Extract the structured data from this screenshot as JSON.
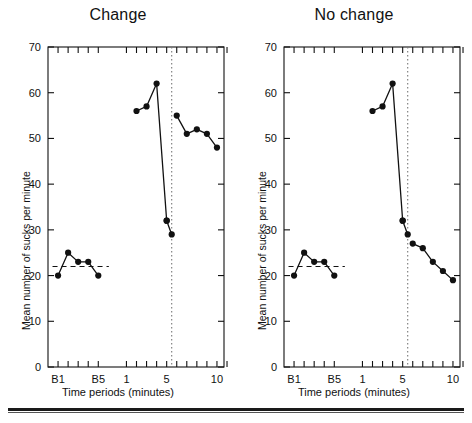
{
  "figure": {
    "bottom_rule": "horizontal-rule",
    "background_color": "#ffffff",
    "ink_color": "#111111"
  },
  "chart_data": [
    {
      "type": "line",
      "title": "Change",
      "xlabel": "Time periods (minutes)",
      "ylabel": "Mean number of sucks per minute",
      "ylim": [
        0,
        70
      ],
      "yticks": [
        0,
        10,
        20,
        30,
        40,
        50,
        60,
        70
      ],
      "ytick_labels": [
        "0",
        "10",
        "20",
        "30",
        "40",
        "50",
        "60",
        "70"
      ],
      "xtick_labels": [
        "B1",
        "B5",
        "1",
        "5",
        "10"
      ],
      "grid": false,
      "legend": null,
      "baseline_reference_line": {
        "value": 22,
        "style": "dashed",
        "label": "baseline-mean"
      },
      "event_marker": {
        "x": 5.5,
        "style": "dotted-vertical",
        "label": "change-onset"
      },
      "series": [
        {
          "name": "baseline",
          "x_labels": [
            "B1",
            "B2",
            "B3",
            "B4",
            "B5"
          ],
          "values": [
            20,
            25,
            23,
            23,
            20
          ]
        },
        {
          "name": "test-phase-before-marker",
          "x_labels": [
            "2",
            "3",
            "4",
            "5"
          ],
          "values": [
            56,
            57,
            62,
            32
          ]
        },
        {
          "name": "test-phase-drop",
          "x_labels": [
            "5",
            "5.5"
          ],
          "values": [
            32,
            29
          ]
        },
        {
          "name": "post-marker",
          "x_labels": [
            "6",
            "7",
            "8",
            "9",
            "10"
          ],
          "values": [
            55,
            51,
            52,
            51,
            48
          ]
        }
      ]
    },
    {
      "type": "line",
      "title": "No change",
      "xlabel": "Time periods (minutes)",
      "ylabel": "Mean number of sucks per minute",
      "ylim": [
        0,
        70
      ],
      "yticks": [
        0,
        10,
        20,
        30,
        40,
        50,
        60,
        70
      ],
      "ytick_labels": [
        "0",
        "10",
        "20",
        "30",
        "40",
        "50",
        "60",
        "70"
      ],
      "xtick_labels": [
        "B1",
        "B5",
        "1",
        "5",
        "10"
      ],
      "grid": false,
      "legend": null,
      "baseline_reference_line": {
        "value": 22,
        "style": "dashed",
        "label": "baseline-mean"
      },
      "event_marker": {
        "x": 5.5,
        "style": "dotted-vertical",
        "label": "change-onset"
      },
      "series": [
        {
          "name": "baseline",
          "x_labels": [
            "B1",
            "B2",
            "B3",
            "B4",
            "B5"
          ],
          "values": [
            20,
            25,
            23,
            23,
            20
          ]
        },
        {
          "name": "test-phase-before-marker",
          "x_labels": [
            "2",
            "3",
            "4",
            "5"
          ],
          "values": [
            56,
            57,
            62,
            32
          ]
        },
        {
          "name": "test-phase-drop",
          "x_labels": [
            "5",
            "5.5"
          ],
          "values": [
            32,
            29
          ]
        },
        {
          "name": "post-marker",
          "x_labels": [
            "6",
            "7",
            "8",
            "9",
            "10"
          ],
          "values": [
            27,
            26,
            23,
            21,
            19
          ]
        }
      ]
    }
  ]
}
